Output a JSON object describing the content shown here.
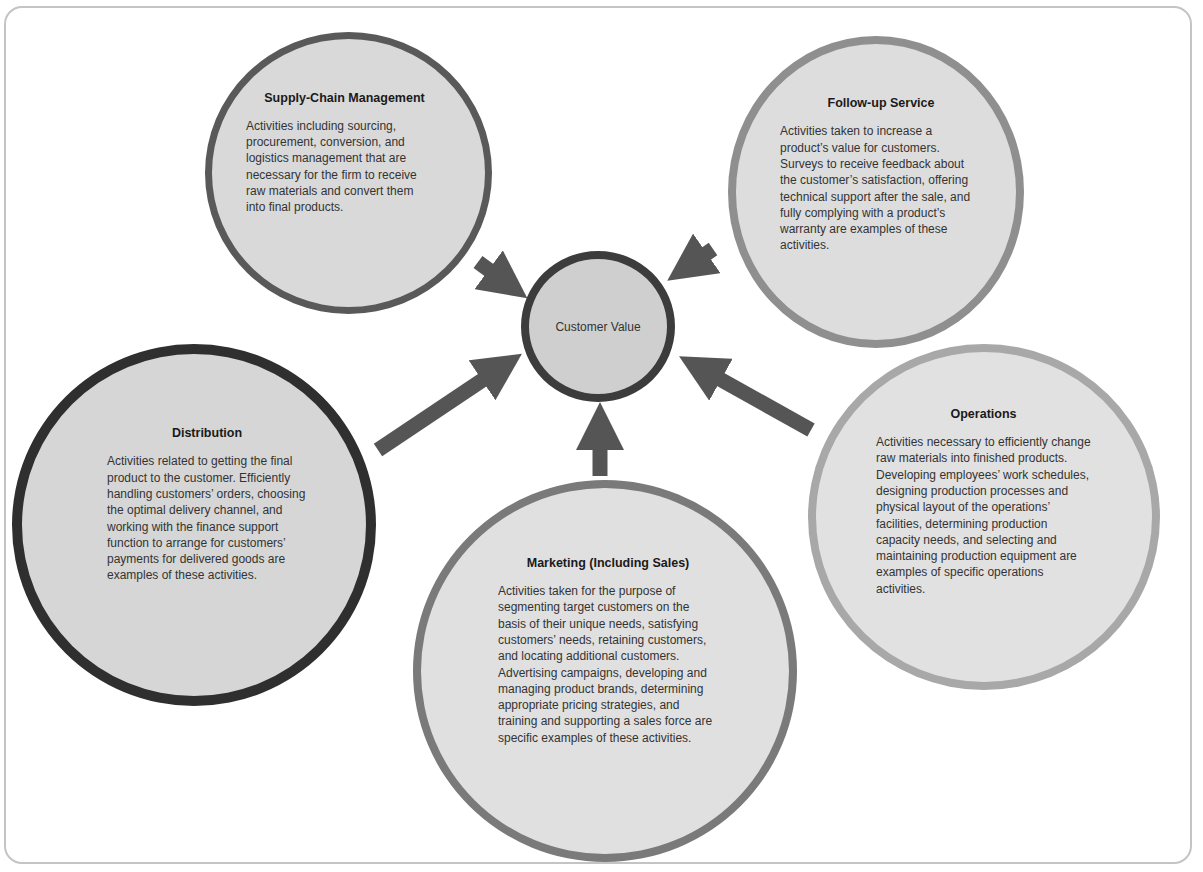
{
  "diagram": {
    "center": {
      "label": "Customer Value"
    },
    "nodes": [
      {
        "id": "supply",
        "title": "Supply-Chain Management",
        "description": "Activities including sourcing, procurement, conversion, and logistics management that are necessary for the firm to receive raw materials and convert them into final products."
      },
      {
        "id": "follow",
        "title": "Follow-up Service",
        "description": "Activities taken to increase a product’s value for customers. Surveys to receive feedback about the customer’s satisfaction, offering technical support after the sale, and fully complying with a product’s warranty are examples of these activities."
      },
      {
        "id": "distribution",
        "title": "Distribution",
        "description": "Activities related to getting the final product to the customer. Efficiently handling customers’ orders, choosing the optimal delivery channel, and working with the finance support function to arrange for customers’ payments for delivered goods are examples of these activities."
      },
      {
        "id": "marketing",
        "title": "Marketing (Including Sales)",
        "description": "Activities taken for the purpose of segmenting target customers on the basis of their unique needs, satisfying customers’ needs, retaining customers, and locating additional customers. Advertising campaigns, developing and managing product brands, determining appropriate pricing strategies, and training and supporting a sales force are specific examples of these activities."
      },
      {
        "id": "operations",
        "title": "Operations",
        "description": "Activities necessary to efficiently change raw materials into finished products. Developing employees’ work schedules, designing production processes and physical layout of the operations’ facilities, determining production capacity needs, and selecting and maintaining production equipment are examples of specific operations activities."
      }
    ],
    "colors": {
      "arrow": "#555555",
      "frame": "#c4c4c4"
    }
  }
}
